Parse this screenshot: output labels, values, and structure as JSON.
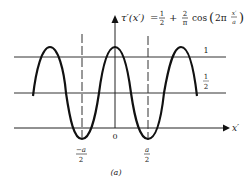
{
  "figure": {
    "caption": "(a)",
    "equation": {
      "lhs": "τ′(x′)",
      "equals": "=",
      "term1_num": "1",
      "term1_den": "2",
      "plus": "+",
      "term2_num": "2",
      "term2_den": "π",
      "func": "cos",
      "arg_prefix": "2π",
      "arg_num": "x′",
      "arg_den": "a"
    },
    "axes": {
      "x_label": "x′",
      "origin_label": "0"
    },
    "levels": [
      {
        "label": "1",
        "value": 1
      },
      {
        "label_num": "1",
        "label_den": "2",
        "value": 0.5
      }
    ],
    "ticks": [
      {
        "num": "−a",
        "den": "2",
        "position": "-a/2"
      },
      {
        "num": "a",
        "den": "2",
        "position": "a/2"
      }
    ],
    "colors": {
      "stroke": "#111111",
      "background": "#ffffff"
    }
  }
}
